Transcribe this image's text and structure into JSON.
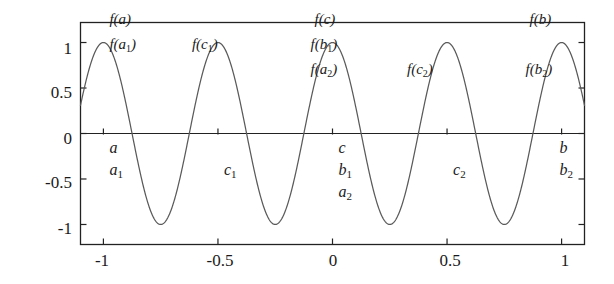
{
  "chart_data": {
    "type": "line",
    "title": "",
    "xlabel": "",
    "ylabel": "",
    "function": "cos(4*pi*x)",
    "xlim": [
      -1.1,
      1.1
    ],
    "ylim": [
      -1.22,
      1.22
    ],
    "xticks": [
      -1,
      -0.5,
      0,
      0.5,
      1
    ],
    "xticklabels": [
      "-1",
      "-0.5",
      "0",
      "0.5",
      "1"
    ],
    "yticks": [
      -1,
      -0.5,
      0,
      0.5,
      1
    ],
    "yticklabels": [
      "-1",
      "-0.5",
      "0",
      "0.5",
      "1"
    ],
    "grid": false,
    "legend": null,
    "line_color": "#555555",
    "axis_color": "#222222",
    "series": [
      {
        "name": "cos(4*pi*x)",
        "x": [
          -1.1,
          -1.05,
          -1.0,
          -0.95,
          -0.9,
          -0.85,
          -0.8,
          -0.75,
          -0.7,
          -0.65,
          -0.6,
          -0.55,
          -0.5,
          -0.45,
          -0.4,
          -0.35,
          -0.3,
          -0.25,
          -0.2,
          -0.15,
          -0.1,
          -0.05,
          0.0,
          0.05,
          0.1,
          0.15,
          0.2,
          0.25,
          0.3,
          0.35,
          0.4,
          0.45,
          0.5,
          0.55,
          0.6,
          0.65,
          0.7,
          0.75,
          0.8,
          0.85,
          0.9,
          0.95,
          1.0,
          1.05,
          1.1
        ],
        "y": [
          0.809,
          0.0,
          -0.809,
          -1.0,
          -0.309,
          0.588,
          1.0,
          0.588,
          -0.309,
          -1.0,
          -0.809,
          0.0,
          1.0,
          0.0,
          -0.809,
          -1.0,
          -0.309,
          0.588,
          1.0,
          0.588,
          -0.309,
          -1.0,
          1.0,
          -1.0,
          -0.309,
          0.588,
          1.0,
          0.588,
          -0.309,
          -1.0,
          -0.809,
          0.0,
          1.0,
          0.0,
          -0.809,
          -1.0,
          -0.309,
          0.588,
          1.0,
          0.588,
          -0.309,
          -1.0,
          -0.809,
          0.0,
          0.809
        ]
      }
    ],
    "annotations": {
      "xaxis_points": [
        {
          "id": "a",
          "label": "a",
          "x": -1.0,
          "stack": 0
        },
        {
          "id": "a1",
          "label": "a",
          "sub": "1",
          "x": -1.0,
          "stack": 1
        },
        {
          "id": "c1",
          "label": "c",
          "sub": "1",
          "x": -0.5,
          "stack": 1
        },
        {
          "id": "c",
          "label": "c",
          "x": 0.0,
          "stack": 0
        },
        {
          "id": "b1",
          "label": "b",
          "sub": "1",
          "x": 0.0,
          "stack": 1
        },
        {
          "id": "a2",
          "label": "a",
          "sub": "2",
          "x": 0.0,
          "stack": 2
        },
        {
          "id": "c2",
          "label": "c",
          "sub": "2",
          "x": 0.5,
          "stack": 1
        },
        {
          "id": "b",
          "label": "b",
          "x": 1.0,
          "stack": 0
        },
        {
          "id": "b2",
          "label": "b",
          "sub": "2",
          "x": 1.0,
          "stack": 1
        }
      ],
      "value_points": [
        {
          "id": "fa",
          "label": "f(a)",
          "x": -1.0,
          "y": 1.0,
          "stack": 0
        },
        {
          "id": "fa1",
          "label": "f(a",
          "sub": "1",
          "close": ")",
          "x": -1.0,
          "y": 1.0,
          "stack": 1
        },
        {
          "id": "fc1",
          "label": "f(c",
          "sub": "1",
          "close": ")",
          "x": -0.5,
          "y": 1.0,
          "stack": 1
        },
        {
          "id": "fc",
          "label": "f(c)",
          "x": 0.0,
          "y": 1.0,
          "stack": 0
        },
        {
          "id": "fb1",
          "label": "f(b",
          "sub": "1",
          "close": ")",
          "x": 0.0,
          "y": 1.0,
          "stack": 1
        },
        {
          "id": "fa2",
          "label": "f(a",
          "sub": "2",
          "close": ")",
          "x": 0.0,
          "y": 1.0,
          "stack": 2
        },
        {
          "id": "fc2",
          "label": "f(c",
          "sub": "2",
          "close": ")",
          "x": 0.5,
          "y": 1.0,
          "stack": 2
        },
        {
          "id": "fb",
          "label": "f(b)",
          "x": 1.0,
          "y": 1.0,
          "stack": 0
        },
        {
          "id": "fb2",
          "label": "f(b",
          "sub": "2",
          "close": ")",
          "x": 1.0,
          "y": 1.0,
          "stack": 2
        }
      ]
    }
  },
  "axes": {
    "y_tick_labels": [
      "1",
      "0.5",
      "0",
      "-0.5",
      "-1"
    ],
    "x_tick_labels": [
      "-1",
      "-0.5",
      "0",
      "0.5",
      "1"
    ]
  }
}
